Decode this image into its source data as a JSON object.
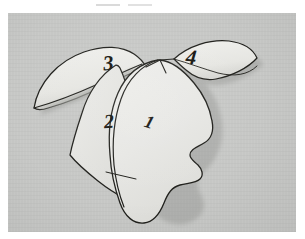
{
  "image": {
    "kind": "photograph",
    "subject": "paper-cutout-head-silhouette-puzzle",
    "alt_text": "Photograph of a light paper cutout shaped like a human head in profile, divided by drawn lines into four numbered regions, lying on a flat gray surface.",
    "width_px": 305,
    "height_px": 239
  },
  "colors": {
    "page_background": "#ffffff",
    "photo_background": "#c6c7c5",
    "paper_fill": "#e9e9e6",
    "paper_fill_shaded": "#dedfdb",
    "ink_outline": "#20201c",
    "drop_shadow": "#9a9b98"
  },
  "photo_frame": {
    "left_px": 8,
    "top_px": 13,
    "width_px": 288,
    "height_px": 219
  },
  "cutout": {
    "description": "Four-piece paper cutout of a head profile",
    "piece_count": 4,
    "pieces": [
      {
        "id": "piece-1",
        "label": "1",
        "region": "main face / front of head",
        "position": "center",
        "lifted": false
      },
      {
        "id": "piece-2",
        "label": "2",
        "region": "back of head / left side panel",
        "position": "left",
        "lifted": false
      },
      {
        "id": "piece-3",
        "label": "3",
        "region": "upper left wing / flap",
        "position": "top-left",
        "lifted": true
      },
      {
        "id": "piece-4",
        "label": "4",
        "region": "upper right wing / flap",
        "position": "top-right",
        "lifted": true
      }
    ]
  },
  "annotations": {
    "handwritten_numbers": [
      "1",
      "2",
      "3",
      "4"
    ],
    "ink_color": "#15140f",
    "style": "handwritten italic numerals"
  },
  "marks": {
    "top_edge_artifact_1": "faint light scan streak",
    "top_edge_artifact_2": "faint light scan streak"
  }
}
